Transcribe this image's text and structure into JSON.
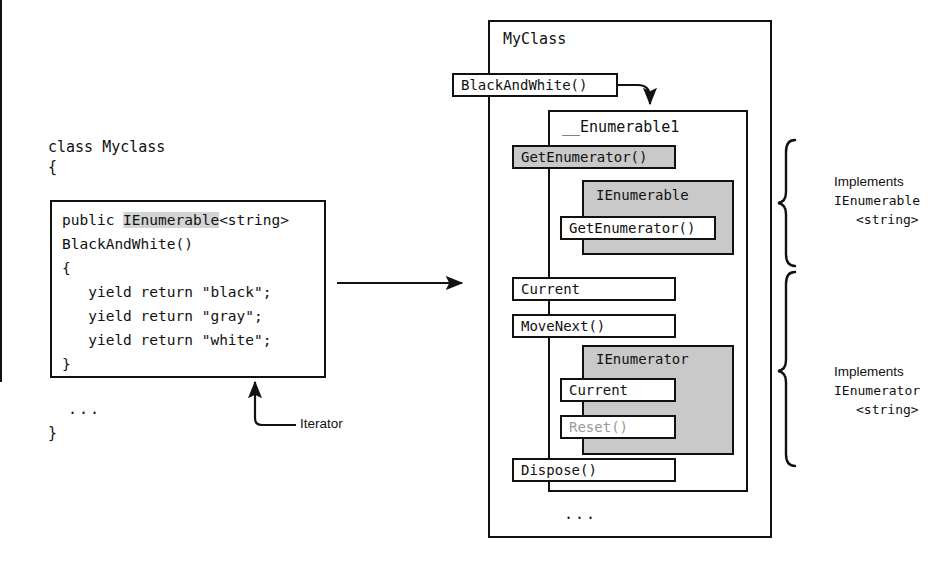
{
  "diagram": {
    "colors": {
      "ink": "#111111",
      "shade": "#c9c9c9",
      "highlight": "#d4d4d4",
      "disabled_text": "#9a9a9a",
      "background": "#ffffff"
    }
  },
  "left": {
    "class_declaration": "class Myclass",
    "brace_open": "{",
    "brace_close": "}",
    "ellipsis": "...",
    "code": {
      "line1_prefix": "public ",
      "line1_highlight": "IEnumerable",
      "line1_suffix": "<string>",
      "line2": "BlackAndWhite()",
      "line3": "{",
      "line4": "   yield return \"black\";",
      "line5": "   yield return \"gray\";",
      "line6": "   yield return \"white\";",
      "line7": "}"
    },
    "callout": {
      "iterator_label": "Iterator"
    }
  },
  "transform_arrow": {
    "label": ""
  },
  "right": {
    "outer_class": {
      "title": "MyClass",
      "ellipsis": "..."
    },
    "method_box": {
      "label": "BlackAndWhite()"
    },
    "nested_class": {
      "title": "__Enumerable1",
      "ellipsis": "...",
      "members": [
        {
          "name": "GetEnumerator()",
          "shaded": true
        },
        {
          "name": "Current",
          "shaded": false
        },
        {
          "name": "MoveNext()",
          "shaded": false
        },
        {
          "name": "Dispose()",
          "shaded": false
        }
      ]
    },
    "interfaces": [
      {
        "name": "IEnumerable",
        "members": [
          {
            "name": "GetEnumerator()",
            "disabled": false
          }
        ]
      },
      {
        "name": "IEnumerator",
        "members": [
          {
            "name": "Current",
            "disabled": false
          },
          {
            "name": "Reset()",
            "disabled": true
          }
        ]
      }
    ],
    "annotations": [
      {
        "word": "Implements",
        "iface": "IEnumerable",
        "generic": "<string>"
      },
      {
        "word": "Implements",
        "iface": "IEnumerator",
        "generic": "<string>"
      }
    ]
  }
}
